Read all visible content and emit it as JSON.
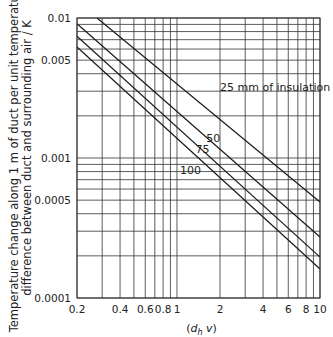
{
  "chart_data": {
    "type": "line",
    "title": "",
    "xlabel": "(d_h v)",
    "ylabel": "Temperature change along 1 m of duct per unit temperature difference between duct and surrounding air / K",
    "ylabel_lines": [
      "Temperature change along 1 m of duct per unit temperature",
      "difference between duct and surrounding air / K"
    ],
    "x_scale": "log",
    "y_scale": "log",
    "xlim": [
      0.2,
      10
    ],
    "ylim": [
      0.0001,
      0.01
    ],
    "grid": true,
    "x_ticks": [
      0.2,
      0.4,
      0.6,
      0.8,
      1,
      2,
      4,
      6,
      8,
      10
    ],
    "x_tick_labels": [
      "0.2",
      "0.4",
      "0.6",
      "0.8",
      "1",
      "2",
      "4",
      "6",
      "8",
      "10"
    ],
    "x_gridlines": [
      0.2,
      0.3,
      0.4,
      0.5,
      0.6,
      0.7,
      0.8,
      0.9,
      1,
      2,
      3,
      4,
      5,
      6,
      7,
      8,
      9,
      10
    ],
    "y_ticks": [
      0.0001,
      0.0005,
      0.001,
      0.005,
      0.01
    ],
    "y_tick_labels": [
      "0.0001",
      "0.0005",
      "0.001",
      "0.005",
      "0.01"
    ],
    "y_gridlines": [
      0.0001,
      0.0002,
      0.0003,
      0.0004,
      0.0005,
      0.0006,
      0.0007,
      0.0008,
      0.0009,
      0.001,
      0.002,
      0.003,
      0.004,
      0.005,
      0.006,
      0.007,
      0.008,
      0.009,
      0.01
    ],
    "series": [
      {
        "name": "25 mm of insulation",
        "label": "25 mm of insulation",
        "x": [
          0.276,
          10
        ],
        "y": [
          0.01,
          0.000485
        ],
        "label_at": [
          2.0,
          0.003
        ]
      },
      {
        "name": "50 mm",
        "label": "50",
        "x": [
          0.2,
          10
        ],
        "y": [
          0.0091,
          0.000273
        ],
        "label_at": [
          1.6,
          0.0013
        ]
      },
      {
        "name": "75 mm",
        "label": "75",
        "x": [
          0.2,
          10
        ],
        "y": [
          0.0074,
          0.000196
        ],
        "label_at": [
          1.35,
          0.00108
        ]
      },
      {
        "name": "100 mm",
        "label": "100",
        "x": [
          0.2,
          10
        ],
        "y": [
          0.0062,
          0.000161
        ],
        "label_at": [
          1.05,
          0.00077
        ]
      }
    ],
    "legend": "inline labels on lines"
  },
  "colors": {
    "line": "#1a1a1a",
    "grid": "#333333",
    "text": "#222222",
    "background": "#ffffff"
  },
  "layout": {
    "plot_left": 77,
    "plot_top": 18,
    "plot_right": 320,
    "plot_bottom": 298
  }
}
